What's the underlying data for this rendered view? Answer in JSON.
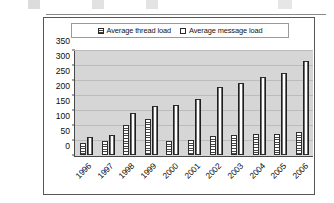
{
  "chart_data": {
    "type": "bar",
    "title": "",
    "subtitle": "",
    "xlabel": "",
    "ylabel": "",
    "ylim": [
      0,
      350
    ],
    "ytick_step": 50,
    "yticks": [
      "0",
      "50",
      "100",
      "150",
      "200",
      "250",
      "300",
      "350"
    ],
    "grid": true,
    "legend_position": "top",
    "categories": [
      "1996",
      "1997",
      "1998",
      "1999",
      "2000",
      "2001",
      "2002",
      "2003",
      "2004",
      "2005",
      "2006"
    ],
    "series": [
      {
        "name": "Average thread load",
        "marker": "striped-square",
        "values": [
          40,
          48,
          102,
          120,
          48,
          52,
          64,
          68,
          70,
          71,
          77
        ]
      },
      {
        "name": "Average message load",
        "marker": "solid-square",
        "values": [
          62,
          68,
          142,
          165,
          168,
          190,
          228,
          242,
          262,
          275,
          318
        ]
      }
    ],
    "colors": {
      "plot_background": "#d6d6d6",
      "gridline": "#bcbcbc",
      "axis": "#4a4a4a",
      "frame_border": "#565656",
      "bar_outline": "#2e2e2e",
      "text": "#0d0d0d"
    }
  },
  "legend": {
    "entries": [
      {
        "label": "Average thread load"
      },
      {
        "label": "Average message load"
      }
    ]
  }
}
